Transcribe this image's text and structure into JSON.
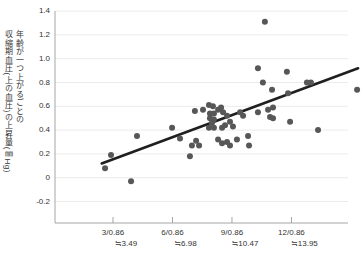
{
  "chart_data": {
    "type": "scatter",
    "title": "",
    "y_axis_label_line1": "年齢が一つ上がるごとの",
    "y_axis_label_line2": "収縮期血圧(上の血圧)の上昇量(㎜Hg)",
    "y_ticks": [
      "1.4",
      "1.2",
      "1.0",
      "0.8",
      "0.6",
      "0.4",
      "0.2",
      "0",
      "-0.2"
    ],
    "x_ticks": [
      {
        "x": 3,
        "label": "3/0.86",
        "approx": "≒3.49"
      },
      {
        "x": 6,
        "label": "6/0.86",
        "approx": "≒6.98"
      },
      {
        "x": 9,
        "label": "9/0.86",
        "approx": "≒10.47"
      },
      {
        "x": 12,
        "label": "12/0.86",
        "approx": "≒13.95"
      }
    ],
    "x_range": [
      0,
      15.4
    ],
    "y_range": [
      -0.38,
      1.4
    ],
    "grid": "horizontal-only",
    "legend": "none",
    "points": [
      [
        2.6,
        0.08
      ],
      [
        2.9,
        0.19
      ],
      [
        3.91,
        -0.03
      ],
      [
        4.21,
        0.35
      ],
      [
        5.98,
        0.42
      ],
      [
        6.38,
        0.33
      ],
      [
        6.88,
        0.18
      ],
      [
        6.98,
        0.27
      ],
      [
        7.19,
        0.31
      ],
      [
        7.34,
        0.27
      ],
      [
        7.13,
        0.56
      ],
      [
        7.54,
        0.57
      ],
      [
        7.84,
        0.61
      ],
      [
        8.04,
        0.6
      ],
      [
        7.89,
        0.54
      ],
      [
        8.09,
        0.54
      ],
      [
        7.89,
        0.5
      ],
      [
        8.09,
        0.49
      ],
      [
        7.99,
        0.46
      ],
      [
        7.84,
        0.42
      ],
      [
        8.09,
        0.42
      ],
      [
        8.3,
        0.57
      ],
      [
        8.45,
        0.59
      ],
      [
        8.55,
        0.55
      ],
      [
        8.75,
        0.52
      ],
      [
        8.9,
        0.47
      ],
      [
        9.05,
        0.43
      ],
      [
        8.65,
        0.44
      ],
      [
        8.5,
        0.42
      ],
      [
        8.3,
        0.32
      ],
      [
        8.5,
        0.29
      ],
      [
        8.75,
        0.3
      ],
      [
        8.9,
        0.27
      ],
      [
        9.25,
        0.32
      ],
      [
        9.41,
        0.55
      ],
      [
        9.56,
        0.52
      ],
      [
        9.81,
        0.35
      ],
      [
        9.86,
        0.27
      ],
      [
        10.31,
        0.92
      ],
      [
        11.77,
        0.89
      ],
      [
        10.56,
        0.8
      ],
      [
        11.02,
        0.74
      ],
      [
        12.78,
        0.8
      ],
      [
        12.98,
        0.8
      ],
      [
        11.83,
        0.71
      ],
      [
        15.31,
        0.74
      ],
      [
        10.31,
        0.55
      ],
      [
        10.82,
        0.57
      ],
      [
        11.07,
        0.59
      ],
      [
        10.92,
        0.51
      ],
      [
        11.07,
        0.5
      ],
      [
        11.93,
        0.47
      ],
      [
        13.34,
        0.4
      ],
      [
        10.66,
        1.31
      ]
    ],
    "trend_line": {
      "x1": 2.43,
      "y1": 0.12,
      "x2": 15.36,
      "y2": 0.92
    },
    "colors": {
      "point": "#575757",
      "trend": "#1f1f1f",
      "grid": "#ebebeb",
      "axis": "#a6a6a6",
      "text": "#333333",
      "background": "#ffffff"
    }
  }
}
